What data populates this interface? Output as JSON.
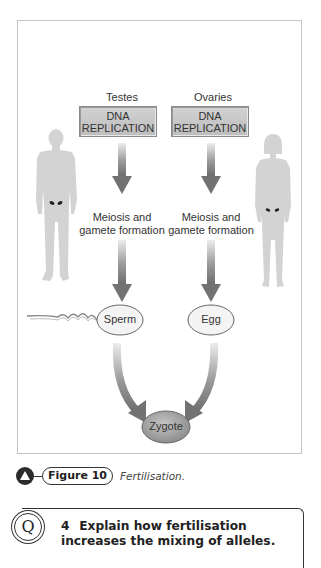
{
  "figure": {
    "organs": {
      "male": "Testes",
      "female": "Ovaries"
    },
    "process_1": {
      "line1": "DNA",
      "line2": "REPLICATION"
    },
    "process_2": {
      "line1": "Meiosis and",
      "line2": "gamete formation"
    },
    "gametes": {
      "male": "Sperm",
      "female": "Egg"
    },
    "result": "Zygote",
    "colors": {
      "box_fill": "#c8c8c8",
      "arrow": "#7a7a7a",
      "silhouette": "#d3d3d3",
      "gonad": "#1e1e1e",
      "zygote_fill": "#a9a9a9",
      "border": "#c4c4c4"
    }
  },
  "caption": {
    "icon": "triangle-icon",
    "label": "Figure 10",
    "text": "Fertilisation."
  },
  "question": {
    "badge": "Q",
    "number": "4",
    "text": "Explain how fertilisation increases the mixing of alleles."
  }
}
